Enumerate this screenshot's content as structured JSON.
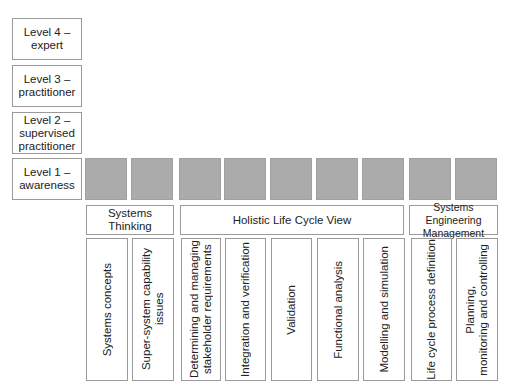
{
  "levels": [
    {
      "label": "Level 4 –\nexpert"
    },
    {
      "label": "Level 3 –\npractitioner"
    },
    {
      "label": "Level 2 –\nsupervised\npractitioner"
    },
    {
      "label": "Level 1 –\nawareness"
    }
  ],
  "groups": [
    {
      "label": "Systems Thinking"
    },
    {
      "label": "Holistic Life Cycle View"
    },
    {
      "label": "Systems Engineering\nManagement"
    }
  ],
  "competencies": [
    {
      "label": "Systems  concepts"
    },
    {
      "label": "Super-system capability\nissues"
    },
    {
      "label": "Determining and managing\nstakeholder requirements"
    },
    {
      "label": "Integration and verification"
    },
    {
      "label": "Validation"
    },
    {
      "label": "Functional analysis"
    },
    {
      "label": "Modelling and simulation"
    },
    {
      "label": "Life cycle process definition"
    },
    {
      "label": "Planning,\nmonitoring and controlling"
    }
  ],
  "colors": {
    "filled": "#ababab",
    "border": "#9a9a9a"
  }
}
